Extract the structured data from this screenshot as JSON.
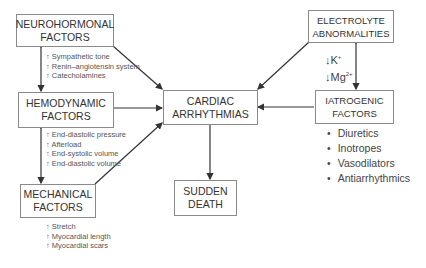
{
  "boxes": {
    "neurohormonal": [
      "NEUROHORMONAL",
      "FACTORS"
    ],
    "hemodynamic": [
      "HEMODYNAMIC",
      "FACTORS"
    ],
    "mechanical": [
      "MECHANICAL",
      "FACTORS"
    ],
    "cardiac": [
      "CARDIAC",
      "ARRHYTHMIAS"
    ],
    "sudden": [
      "SUDDEN",
      "DEATH"
    ],
    "electrolyte": [
      "ELECTROLYTE",
      "ABNORMALITIES"
    ],
    "iatrogenic": [
      "IATROGENIC",
      "FACTORS"
    ]
  },
  "notes": {
    "neuro": [
      "↑ Sympathetic tone",
      "↑ Renin–angiotensin system",
      "↑ Catecholamines"
    ],
    "hemo": [
      "↑ End-diastolic pressure",
      "↑ Afterload",
      "↑ End-systolic volume",
      "↑ End-diastolic volume"
    ],
    "mech": [
      "↑ Stretch",
      "↑ Myocardial length",
      "↑ Myocardial scars"
    ]
  },
  "ions": {
    "k": "↓K",
    "k_sup": "+",
    "mg": "↓Mg",
    "mg_sup": "2+"
  },
  "iatrogenic_list": [
    "Diuretics",
    "Inotropes",
    "Vasodilators",
    "Antiarrhythmics"
  ],
  "colors": {
    "line": "#333333",
    "border": "#8a8a8a"
  }
}
